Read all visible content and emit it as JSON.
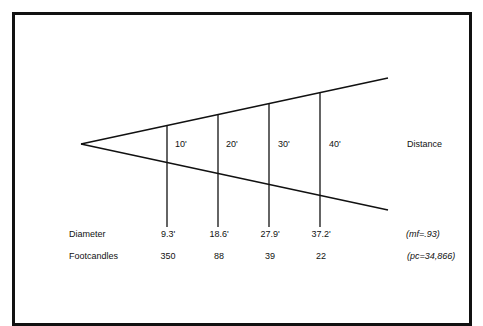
{
  "diagram": {
    "type": "light-beam-cone",
    "distance_label": "Distance",
    "distance_marks": [
      "10'",
      "20'",
      "30'",
      "40'"
    ],
    "rows": [
      {
        "label": "Diameter",
        "values": [
          "9.3'",
          "18.6'",
          "27.9'",
          "37.2'"
        ],
        "note": "(mf=.93)"
      },
      {
        "label": "Footcandles",
        "values": [
          "350",
          "88",
          "39",
          "22"
        ],
        "note": "(pc=34,866)"
      }
    ],
    "colors": {
      "line": "#111111",
      "background": "#ffffff",
      "text": "#111111"
    }
  }
}
